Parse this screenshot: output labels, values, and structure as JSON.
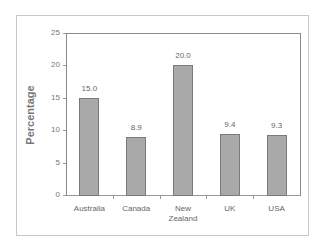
{
  "chart_data": {
    "type": "bar",
    "title": "",
    "xlabel": "",
    "ylabel": "Percentage",
    "categories": [
      "Australia",
      "Canada",
      "New Zealand",
      "UK",
      "USA"
    ],
    "category_lines": [
      [
        "Australia"
      ],
      [
        "Canada"
      ],
      [
        "New",
        "Zealand"
      ],
      [
        "UK"
      ],
      [
        "USA"
      ]
    ],
    "values": [
      15.0,
      8.9,
      20.0,
      9.4,
      9.3
    ],
    "value_labels": [
      "15.0",
      "8.9",
      "20.0",
      "9.4",
      "9.3"
    ],
    "ylim": [
      0,
      25
    ],
    "yticks": [
      "0",
      "5",
      "10",
      "15",
      "20",
      "25"
    ],
    "grid": false,
    "legend": null,
    "bar_color": "#a9a9a9",
    "bar_edge_color": "#7a7a7a"
  }
}
